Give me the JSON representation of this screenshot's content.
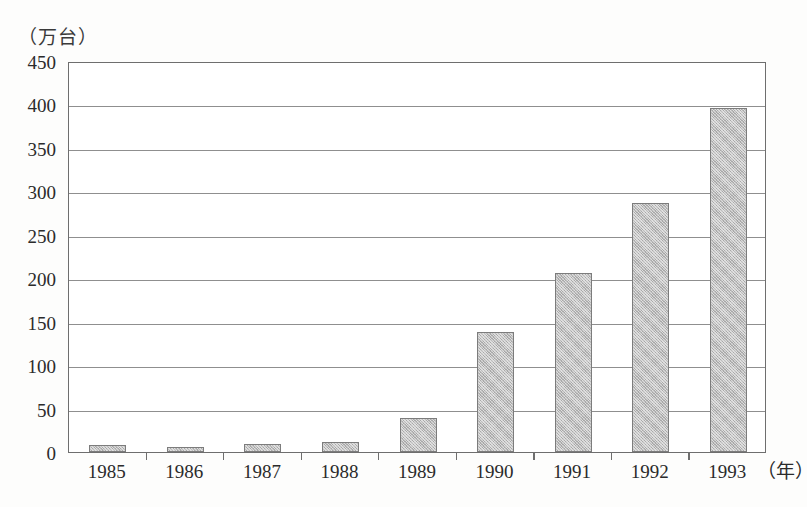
{
  "chart_data": {
    "type": "bar",
    "title": "",
    "unit_label": "（万台）",
    "ylabel": "（万台）",
    "xlabel": "（年）",
    "categories": [
      "1985",
      "1986",
      "1987",
      "1988",
      "1989",
      "1990",
      "1991",
      "1992",
      "1993"
    ],
    "values": [
      8,
      6,
      9,
      12,
      39,
      138,
      206,
      287,
      396
    ],
    "ylim": [
      0,
      450
    ],
    "ytick_labels": [
      "450",
      "400",
      "350",
      "300",
      "250",
      "200",
      "150",
      "100",
      "50",
      "0"
    ],
    "ytick_values": [
      450,
      400,
      350,
      300,
      250,
      200,
      150,
      100,
      50,
      0
    ],
    "grid": true,
    "legend": null,
    "series": [
      {
        "name": "",
        "values": [
          8,
          6,
          9,
          12,
          39,
          138,
          206,
          287,
          396
        ]
      }
    ],
    "colors": {
      "bar_fill": "#bdbdbd",
      "bar_border": "#7c7c7c",
      "gridline": "#8f8f8f",
      "axis": "#6e6e6e",
      "text": "#2b2b2b",
      "background": "#fdfdfc"
    }
  }
}
